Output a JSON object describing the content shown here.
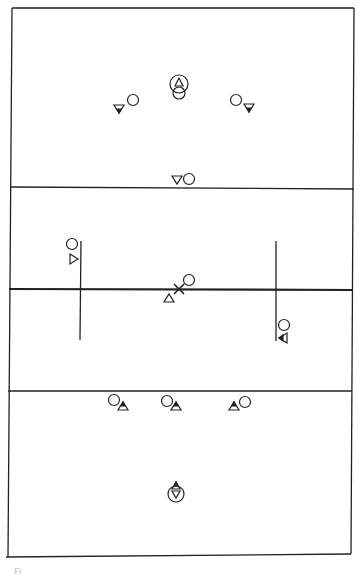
{
  "diagram": {
    "type": "lacrosse-field-player-positions",
    "line_color": "#222222",
    "caption_fragment": "Fi"
  },
  "legend": {
    "circle": "player (team A)",
    "triangle-up": "player (team B)",
    "triangle-down": "player (team B)",
    "x": "ball / center face-off"
  },
  "field": {
    "lines": [
      "top-end-line",
      "upper-restraining-line",
      "midfield-line",
      "lower-restraining-line",
      "bottom-end-line"
    ],
    "wing_lines": [
      "left-wing-line",
      "right-wing-line"
    ]
  },
  "players": [
    {
      "id": "top-goal",
      "shape": "circle-with-triangle-and-circle",
      "zone": "top"
    },
    {
      "id": "top-left-circle",
      "shape": "circle",
      "zone": "top"
    },
    {
      "id": "top-left-triangle",
      "shape": "triangle-down-filled-tip",
      "zone": "top"
    },
    {
      "id": "top-right-circle",
      "shape": "circle",
      "zone": "top"
    },
    {
      "id": "top-right-triangle",
      "shape": "triangle-down-filled-tip",
      "zone": "top"
    },
    {
      "id": "upper-line-triangle",
      "shape": "triangle-down",
      "zone": "top"
    },
    {
      "id": "upper-line-circle",
      "shape": "circle",
      "zone": "top"
    },
    {
      "id": "left-wing-circle",
      "shape": "circle",
      "zone": "mid"
    },
    {
      "id": "left-wing-triangle",
      "shape": "triangle-right",
      "zone": "mid"
    },
    {
      "id": "center-circle",
      "shape": "circle",
      "zone": "mid"
    },
    {
      "id": "center-triangle",
      "shape": "triangle-up",
      "zone": "mid"
    },
    {
      "id": "center-x",
      "shape": "x",
      "zone": "mid"
    },
    {
      "id": "right-wing-circle",
      "shape": "circle",
      "zone": "mid"
    },
    {
      "id": "right-wing-triangle",
      "shape": "triangle-left",
      "zone": "mid"
    },
    {
      "id": "bottom-left-circle",
      "shape": "circle",
      "zone": "bottom"
    },
    {
      "id": "bottom-left-triangle",
      "shape": "triangle-up-filled-tip",
      "zone": "bottom"
    },
    {
      "id": "bottom-mid-circle",
      "shape": "circle",
      "zone": "bottom"
    },
    {
      "id": "bottom-mid-triangle",
      "shape": "triangle-up-filled-tip",
      "zone": "bottom"
    },
    {
      "id": "bottom-right-triangle",
      "shape": "triangle-up-filled-tip",
      "zone": "bottom"
    },
    {
      "id": "bottom-right-circle",
      "shape": "circle",
      "zone": "bottom"
    },
    {
      "id": "bottom-goal",
      "shape": "circle-with-triangle-down-and-triangle-up",
      "zone": "bottom"
    }
  ]
}
